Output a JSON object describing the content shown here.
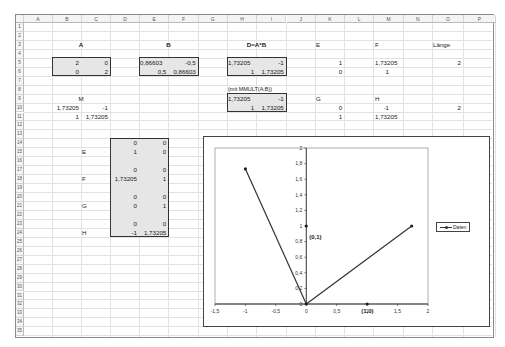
{
  "spreadsheet": {
    "columns": [
      "A",
      "B",
      "C",
      "D",
      "E",
      "F",
      "G",
      "H",
      "I",
      "J",
      "K",
      "L",
      "M",
      "N",
      "O",
      "P"
    ],
    "rows": [
      "1",
      "2",
      "3",
      "4",
      "5",
      "6",
      "7",
      "8",
      "9",
      "10",
      "11",
      "12",
      "13",
      "14",
      "15",
      "16",
      "17",
      "18",
      "19",
      "20",
      "21",
      "22",
      "23",
      "24",
      "25",
      "26",
      "27",
      "28",
      "29",
      "30",
      "31",
      "32",
      "33",
      "34",
      "35"
    ],
    "headings": {
      "A": "A",
      "B": "B",
      "D": "D=A*B",
      "E": "E",
      "F": "F",
      "laenge": "Länge",
      "M": "M",
      "G": "G",
      "H": "H",
      "mmult_note": "(mit MMULT(A;B))"
    },
    "matrix_A": [
      [
        "2",
        "0"
      ],
      [
        "0",
        "2"
      ]
    ],
    "matrix_B": [
      [
        "0,86603",
        "-0,5"
      ],
      [
        "0,5",
        "0,86603"
      ]
    ],
    "matrix_D": [
      [
        "1,73205",
        "-1"
      ],
      [
        "1",
        "1,73205"
      ]
    ],
    "matrix_D_mmult": [
      [
        "1,73205",
        "-1"
      ],
      [
        "1",
        "1,73205"
      ]
    ],
    "matrix_M": [
      [
        "1,73205",
        "-1"
      ],
      [
        "1",
        "1,73205"
      ]
    ],
    "vec_E": [
      "1",
      "0"
    ],
    "vec_F": [
      "1,73205",
      "1"
    ],
    "vec_G": [
      "0",
      "1"
    ],
    "vec_H": [
      "-1",
      "1,73205"
    ],
    "laenge_values": [
      "2",
      "2"
    ],
    "pairs_block": {
      "E_label": "E",
      "F_label": "F",
      "G_label": "G",
      "H_label": "H",
      "rows": [
        [
          "0",
          "0"
        ],
        [
          "1",
          "0"
        ],
        [
          "0",
          "0"
        ],
        [
          "1,73205",
          "1"
        ],
        [
          "0",
          "0"
        ],
        [
          "0",
          "1"
        ],
        [
          "0",
          "0"
        ],
        [
          "-1",
          "1,73205"
        ]
      ]
    }
  },
  "chart_data": {
    "type": "scatter",
    "title": "",
    "xlabel": "",
    "ylabel": "",
    "xlim": [
      -1.5,
      2
    ],
    "ylim": [
      0,
      2
    ],
    "x_ticks": [
      "-1,5",
      "-1",
      "-0,5",
      "0",
      "0,5",
      "1",
      "1,5",
      "2"
    ],
    "x_tick_values": [
      -1.5,
      -1,
      -0.5,
      0,
      0.5,
      1,
      1.5,
      2
    ],
    "y_ticks": [
      "0",
      "0,2",
      "0,4",
      "0,6",
      "0,8",
      "1",
      "1,2",
      "1,4",
      "1,6",
      "1,8",
      "2"
    ],
    "y_tick_values": [
      0,
      0.2,
      0.4,
      0.6,
      0.8,
      1,
      1.2,
      1.4,
      1.6,
      1.8,
      2
    ],
    "grid": false,
    "legend_position": "right",
    "series": [
      {
        "name": "Daten",
        "lines": [
          [
            [
              0,
              0
            ],
            [
              1.73205,
              1
            ]
          ],
          [
            [
              0,
              0
            ],
            [
              -1,
              1.73205
            ]
          ]
        ],
        "points": [
          [
            0,
            0
          ],
          [
            1.73205,
            1
          ],
          [
            -1,
            1.73205
          ],
          [
            0,
            1
          ],
          [
            1,
            0
          ]
        ]
      }
    ],
    "annotations": [
      {
        "text": "(0,1)",
        "x": 0,
        "y": 1
      },
      {
        "text": "(1,0)",
        "x": 1,
        "y": 0
      }
    ]
  }
}
